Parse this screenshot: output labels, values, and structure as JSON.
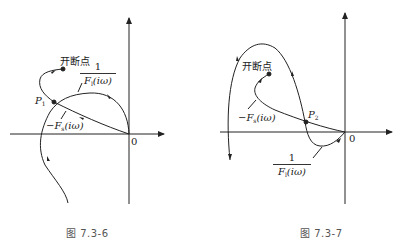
{
  "figures": [
    {
      "id": "fig-7.3-6",
      "caption": "图 7.3-6",
      "origin_label": "0",
      "break_point_label": "开断点",
      "intersection_label": "P",
      "intersection_sub": "1",
      "neg_F_label": "−F",
      "neg_F_sub": "s",
      "neg_F_arg": "(iω)",
      "inv_F_num": "1",
      "inv_F_den": "F",
      "inv_F_sub": "l",
      "inv_F_arg": "(iω)"
    },
    {
      "id": "fig-7.3-7",
      "caption": "图 7.3-7",
      "origin_label": "0",
      "break_point_label": "开断点",
      "intersection_label": "P",
      "intersection_sub": "2",
      "neg_F_label": "−F",
      "neg_F_sub": "s",
      "neg_F_arg": "(iω)",
      "inv_F_num": "1",
      "inv_F_den": "F",
      "inv_F_sub": "l",
      "inv_F_arg": "(iω)"
    }
  ],
  "colors": {
    "ink": "#222222",
    "caption": "#555555",
    "background": "#ffffff"
  }
}
